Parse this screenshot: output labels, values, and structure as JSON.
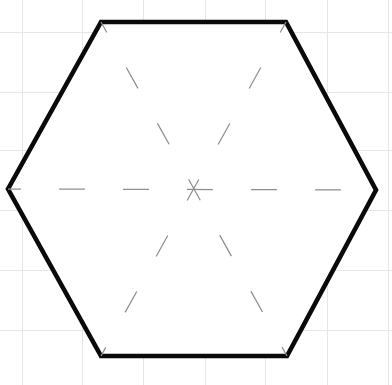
{
  "figure": {
    "width": 392,
    "height": 385,
    "background_color": "#ffffff",
    "grid": {
      "visible": true,
      "color": "#e4e6e8",
      "spacing": 60,
      "x_positions": [
        22,
        82,
        143,
        205,
        265,
        327,
        388
      ],
      "y_positions": [
        32,
        92,
        150,
        210,
        270,
        330
      ]
    }
  },
  "shape": {
    "name": "hexagon",
    "sides": 6,
    "stroke_color": "#0a0a0a",
    "stroke_width": 4.6,
    "fill_color": "#ffffff",
    "center": {
      "x": 193,
      "y": 189
    },
    "vertices": [
      {
        "label": "top-left",
        "x": 101,
        "y": 22
      },
      {
        "label": "top-right",
        "x": 286,
        "y": 22
      },
      {
        "label": "right",
        "x": 376,
        "y": 190
      },
      {
        "label": "bottom-right",
        "x": 287,
        "y": 356
      },
      {
        "label": "bottom-left",
        "x": 101,
        "y": 356
      },
      {
        "label": "left",
        "x": 8,
        "y": 189
      }
    ],
    "points_attr": "101,22 286,22 376,190 287,356 101,356 8,189"
  },
  "diagonals": {
    "count": 3,
    "style": "dashed",
    "stroke_color": "#8d8f92",
    "stroke_width": 1.25,
    "dash_length": 24,
    "gap_length": 40,
    "lines": [
      {
        "name": "horizontal-diagonal",
        "from": "left",
        "to": "right",
        "x1": 8,
        "y1": 189,
        "x2": 376,
        "y2": 190
      },
      {
        "name": "top-left-to-bottom-right-diagonal",
        "from": "top-left",
        "to": "bottom-right",
        "x1": 101,
        "y1": 22,
        "x2": 287,
        "y2": 356
      },
      {
        "name": "top-right-to-bottom-left-diagonal",
        "from": "top-right",
        "to": "bottom-left",
        "x1": 286,
        "y1": 22,
        "x2": 101,
        "y2": 356
      }
    ]
  }
}
